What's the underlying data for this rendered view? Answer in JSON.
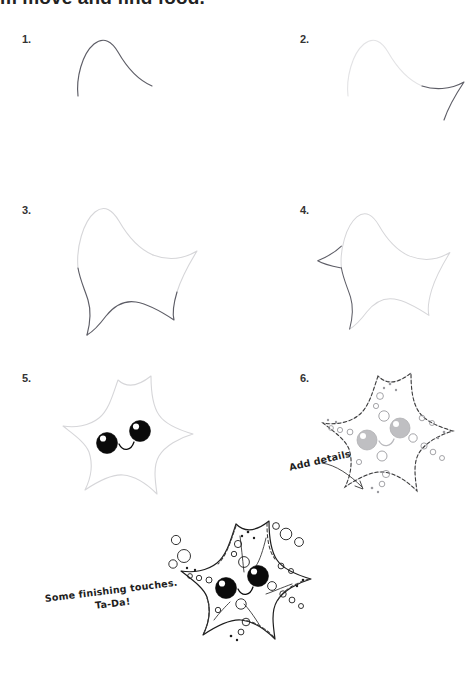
{
  "document": {
    "type": "drawing-tutorial",
    "subject": "starfish",
    "header_text_clipped": "m move and find food."
  },
  "steps": [
    {
      "number": "1.",
      "stage": "first-arm"
    },
    {
      "number": "2.",
      "stage": "second-arm"
    },
    {
      "number": "3.",
      "stage": "third-and-fourth-arm"
    },
    {
      "number": "4.",
      "stage": "complete-star-outline"
    },
    {
      "number": "5.",
      "stage": "add-face-eyes-and-smile"
    },
    {
      "number": "6.",
      "stage": "add-texture-details"
    }
  ],
  "annotations": {
    "add_details": "Add details",
    "finishing_line1": "Some finishing touches.",
    "finishing_line2": "Ta-Da!"
  },
  "colors": {
    "paper": "#ffffff",
    "guide_line": "#e3e3e5",
    "new_line": "#5d5d66",
    "final_line": "#1d1d1d",
    "eye_fill": "#0a0a0a",
    "eye_fill_draft": "#bfbfc2",
    "text": "#222222"
  }
}
